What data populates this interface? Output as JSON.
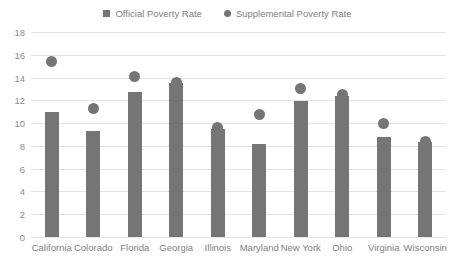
{
  "chart_data": {
    "type": "bar",
    "title": "",
    "xlabel": "",
    "ylabel": "",
    "ylim": [
      0,
      18
    ],
    "ytick_step": 2,
    "yticks": [
      0,
      2,
      4,
      6,
      8,
      10,
      12,
      14,
      16,
      18
    ],
    "grid": true,
    "legend_position": "top-center",
    "categories": [
      "California",
      "Colorado",
      "Florida",
      "Georgia",
      "Illinois",
      "Maryland",
      "New York",
      "Ohio",
      "Virginia",
      "Wisconsin"
    ],
    "series": [
      {
        "name": "Official Poverty Rate",
        "type": "bar",
        "marker": "square",
        "color": "#757575",
        "values": [
          11.0,
          9.3,
          12.7,
          13.5,
          9.5,
          8.2,
          11.9,
          12.4,
          8.8,
          8.3
        ]
      },
      {
        "name": "Supplemental Poverty Rate",
        "type": "scatter",
        "marker": "circle",
        "color": "#757575",
        "values": [
          15.4,
          11.3,
          14.1,
          13.6,
          9.6,
          10.8,
          13.0,
          12.5,
          10.0,
          8.4
        ]
      }
    ]
  },
  "legend": {
    "entries": [
      {
        "label": "Official Poverty Rate",
        "marker": "square-marker-icon"
      },
      {
        "label": "Supplemental Poverty Rate",
        "marker": "circle-marker-icon"
      }
    ]
  },
  "colors": {
    "bar": "#757575",
    "dot": "#757575",
    "gridline": "#e3e3e3",
    "text": "#808080",
    "background": "#ffffff"
  }
}
